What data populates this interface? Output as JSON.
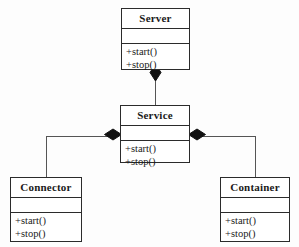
{
  "diagram": {
    "notation": "UML class diagram",
    "stroke_color": "#2b2b2b",
    "fill_color": "#ffffff",
    "background_color": "#fdfdfd",
    "classes": [
      {
        "id": "server",
        "name": "Server",
        "attributes": [],
        "operations": [
          "+start()",
          "+stop()"
        ]
      },
      {
        "id": "service",
        "name": "Service",
        "attributes": [],
        "operations": [
          "+start()",
          "+stop()"
        ]
      },
      {
        "id": "connector",
        "name": "Connector",
        "attributes": [],
        "operations": [
          "+start()",
          "+stop()"
        ]
      },
      {
        "id": "container",
        "name": "Container",
        "attributes": [],
        "operations": [
          "+start()",
          "+stop()"
        ]
      }
    ],
    "relationships": [
      {
        "id": "server-service",
        "type": "composition",
        "whole": "Server",
        "part": "Service",
        "diamond": "filled"
      },
      {
        "id": "service-connector",
        "type": "composition",
        "whole": "Service",
        "part": "Connector",
        "diamond": "filled"
      },
      {
        "id": "service-container",
        "type": "composition",
        "whole": "Service",
        "part": "Container",
        "diamond": "filled"
      }
    ]
  }
}
